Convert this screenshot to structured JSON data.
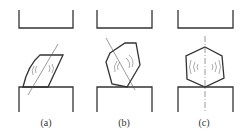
{
  "figure": {
    "panels": [
      {
        "id": "a",
        "label": "(a)",
        "description": "crystal tilted, contacting anvil at an edge"
      },
      {
        "id": "b",
        "label": "(b)",
        "description": "hexagonal crystal tilted, contacting anvil at a vertex"
      },
      {
        "id": "c",
        "label": "(c)",
        "description": "hexagonal crystal upright, vertex-centered on anvil"
      }
    ],
    "colors": {
      "stroke": "#333333",
      "thin": "#555555",
      "background": "#ffffff"
    }
  }
}
